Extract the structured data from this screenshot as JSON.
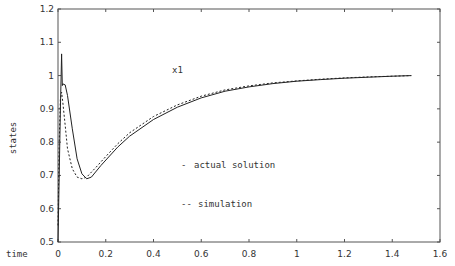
{
  "chart_data": {
    "type": "line",
    "title": "x1",
    "xlabel": "time",
    "ylabel": "states",
    "xlim": [
      0,
      1.6
    ],
    "ylim": [
      0.5,
      1.2
    ],
    "xticks": [
      0,
      0.2,
      0.4,
      0.6,
      0.8,
      1,
      1.2,
      1.4,
      1.6
    ],
    "xtick_labels": [
      "0",
      "0.2",
      "0.4",
      "0.6",
      "0.8",
      "1",
      "1.2",
      "1.4",
      "1.6"
    ],
    "yticks": [
      0.5,
      0.6,
      0.7,
      0.8,
      0.9,
      1.0,
      1.1,
      1.2
    ],
    "ytick_labels": [
      "0.5",
      "0.6",
      "0.7",
      "0.8",
      "0.9",
      "1",
      "1.1",
      "1.2"
    ],
    "grid": false,
    "legend": {
      "position": "inside-center",
      "entries": [
        {
          "marker": "-",
          "label": "actual solution"
        },
        {
          "marker": "--",
          "label": "simulation"
        }
      ]
    },
    "series": [
      {
        "name": "actual solution",
        "style": "solid",
        "x": [
          0,
          0.01,
          0.015,
          0.018,
          0.02,
          0.03,
          0.04,
          0.06,
          0.08,
          0.1,
          0.12,
          0.14,
          0.18,
          0.25,
          0.3,
          0.4,
          0.5,
          0.6,
          0.7,
          0.8,
          0.9,
          1.0,
          1.1,
          1.2,
          1.3,
          1.4,
          1.48
        ],
        "y": [
          0.5,
          0.9,
          1.065,
          0.97,
          0.975,
          0.972,
          0.94,
          0.84,
          0.75,
          0.705,
          0.69,
          0.695,
          0.73,
          0.785,
          0.818,
          0.868,
          0.905,
          0.933,
          0.953,
          0.966,
          0.976,
          0.983,
          0.988,
          0.992,
          0.995,
          0.998,
          1.0
        ]
      },
      {
        "name": "simulation",
        "style": "dashed",
        "x": [
          0,
          0.005,
          0.01,
          0.015,
          0.02,
          0.03,
          0.04,
          0.06,
          0.08,
          0.1,
          0.12,
          0.16,
          0.2,
          0.25,
          0.3,
          0.4,
          0.5,
          0.6,
          0.7,
          0.8,
          0.9,
          1.0,
          1.1,
          1.2,
          1.3,
          1.4,
          1.48
        ],
        "y": [
          0.55,
          0.8,
          0.93,
          0.95,
          0.92,
          0.85,
          0.78,
          0.72,
          0.695,
          0.69,
          0.695,
          0.725,
          0.757,
          0.795,
          0.828,
          0.877,
          0.912,
          0.938,
          0.957,
          0.969,
          0.978,
          0.984,
          0.989,
          0.993,
          0.996,
          0.998,
          1.0
        ]
      }
    ]
  }
}
